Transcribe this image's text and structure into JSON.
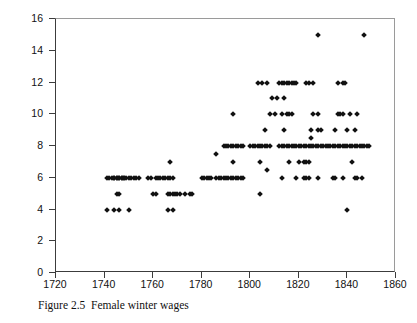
{
  "caption": "Figure 2.5  Female winter wages",
  "axis_color": "#3c3c3c",
  "marker_color": "#111111",
  "chart_data": {
    "type": "scatter",
    "title": "",
    "subtitle": "",
    "xlabel": "",
    "ylabel": "Female Winter Wage (d./day)",
    "xlim": [
      1720,
      1860
    ],
    "ylim": [
      0,
      16
    ],
    "xticks": [
      1720,
      1740,
      1760,
      1780,
      1800,
      1820,
      1840,
      1860
    ],
    "yticks": [
      0,
      2,
      4,
      6,
      8,
      10,
      12,
      14,
      16
    ],
    "grid": false,
    "legend": null,
    "marker": "diamond",
    "series": [
      {
        "name": "Female winter wage observations",
        "points": [
          [
            1741,
            6
          ],
          [
            1742,
            6
          ],
          [
            1743,
            6
          ],
          [
            1744,
            6
          ],
          [
            1744,
            6
          ],
          [
            1745,
            6
          ],
          [
            1745,
            6
          ],
          [
            1746,
            6
          ],
          [
            1746,
            6
          ],
          [
            1747,
            6
          ],
          [
            1747,
            6
          ],
          [
            1748,
            6
          ],
          [
            1748,
            6
          ],
          [
            1749,
            6
          ],
          [
            1750,
            6
          ],
          [
            1751,
            6
          ],
          [
            1752,
            6
          ],
          [
            1753,
            6
          ],
          [
            1754,
            6
          ],
          [
            1758,
            6
          ],
          [
            1759,
            6
          ],
          [
            1761,
            6
          ],
          [
            1762,
            6
          ],
          [
            1763,
            6
          ],
          [
            1764,
            6
          ],
          [
            1765,
            6
          ],
          [
            1766,
            6
          ],
          [
            1767,
            6
          ],
          [
            1768,
            6
          ],
          [
            1741,
            4
          ],
          [
            1744,
            4
          ],
          [
            1746,
            4
          ],
          [
            1750,
            4
          ],
          [
            1766,
            4
          ],
          [
            1768,
            4
          ],
          [
            1745,
            5
          ],
          [
            1746,
            5
          ],
          [
            1760,
            5
          ],
          [
            1761,
            5
          ],
          [
            1766,
            5
          ],
          [
            1767,
            5
          ],
          [
            1768,
            5
          ],
          [
            1769,
            5
          ],
          [
            1770,
            5
          ],
          [
            1771,
            5
          ],
          [
            1773,
            5
          ],
          [
            1775,
            5
          ],
          [
            1776,
            5
          ],
          [
            1767,
            7
          ],
          [
            1780,
            6
          ],
          [
            1781,
            6
          ],
          [
            1782,
            6
          ],
          [
            1783,
            6
          ],
          [
            1784,
            6
          ],
          [
            1786,
            6
          ],
          [
            1787,
            6
          ],
          [
            1788,
            6
          ],
          [
            1789,
            6
          ],
          [
            1790,
            6
          ],
          [
            1791,
            6
          ],
          [
            1792,
            6
          ],
          [
            1793,
            6
          ],
          [
            1794,
            6
          ],
          [
            1795,
            6
          ],
          [
            1796,
            6
          ],
          [
            1797,
            6
          ],
          [
            1786,
            7.5
          ],
          [
            1789,
            8
          ],
          [
            1790,
            8
          ],
          [
            1791,
            8
          ],
          [
            1792,
            8
          ],
          [
            1793,
            8
          ],
          [
            1794,
            8
          ],
          [
            1795,
            8
          ],
          [
            1796,
            8
          ],
          [
            1797,
            8
          ],
          [
            1793,
            10
          ],
          [
            1793,
            7
          ],
          [
            1800,
            8
          ],
          [
            1801,
            8
          ],
          [
            1802,
            8
          ],
          [
            1803,
            8
          ],
          [
            1804,
            8
          ],
          [
            1805,
            8
          ],
          [
            1806,
            8
          ],
          [
            1807,
            8
          ],
          [
            1808,
            8
          ],
          [
            1803,
            12
          ],
          [
            1805,
            12
          ],
          [
            1807,
            12
          ],
          [
            1804,
            5
          ],
          [
            1804,
            7
          ],
          [
            1806,
            9
          ],
          [
            1807,
            6.5
          ],
          [
            1808,
            10
          ],
          [
            1810,
            10
          ],
          [
            1809,
            11
          ],
          [
            1811,
            11
          ],
          [
            1814,
            11
          ],
          [
            1812,
            12
          ],
          [
            1813,
            12
          ],
          [
            1814,
            12
          ],
          [
            1815,
            12
          ],
          [
            1816,
            12
          ],
          [
            1817,
            12
          ],
          [
            1818,
            12
          ],
          [
            1819,
            12
          ],
          [
            1812,
            8
          ],
          [
            1813,
            8
          ],
          [
            1814,
            8
          ],
          [
            1815,
            8
          ],
          [
            1816,
            8
          ],
          [
            1817,
            8
          ],
          [
            1818,
            8
          ],
          [
            1819,
            8
          ],
          [
            1813,
            10
          ],
          [
            1815,
            10
          ],
          [
            1816,
            10
          ],
          [
            1817,
            10
          ],
          [
            1814,
            9
          ],
          [
            1813,
            6
          ],
          [
            1816,
            7
          ],
          [
            1820,
            8
          ],
          [
            1821,
            8
          ],
          [
            1822,
            8
          ],
          [
            1823,
            8
          ],
          [
            1824,
            8
          ],
          [
            1825,
            8
          ],
          [
            1826,
            8
          ],
          [
            1827,
            8
          ],
          [
            1828,
            8
          ],
          [
            1829,
            8
          ],
          [
            1830,
            8
          ],
          [
            1831,
            8
          ],
          [
            1832,
            8
          ],
          [
            1833,
            8
          ],
          [
            1834,
            8
          ],
          [
            1835,
            8
          ],
          [
            1836,
            8
          ],
          [
            1837,
            8
          ],
          [
            1838,
            8
          ],
          [
            1839,
            8
          ],
          [
            1840,
            8
          ],
          [
            1841,
            8
          ],
          [
            1842,
            8
          ],
          [
            1843,
            8
          ],
          [
            1844,
            8
          ],
          [
            1845,
            8
          ],
          [
            1846,
            8
          ],
          [
            1847,
            8
          ],
          [
            1848,
            8
          ],
          [
            1849,
            8
          ],
          [
            1820,
            7
          ],
          [
            1822,
            7
          ],
          [
            1823,
            7
          ],
          [
            1824,
            7
          ],
          [
            1819,
            6
          ],
          [
            1822,
            6
          ],
          [
            1823,
            6
          ],
          [
            1824,
            6
          ],
          [
            1828,
            6
          ],
          [
            1834,
            6
          ],
          [
            1835,
            6
          ],
          [
            1838,
            6
          ],
          [
            1823,
            12
          ],
          [
            1824,
            12
          ],
          [
            1826,
            12
          ],
          [
            1825,
            8.5
          ],
          [
            1826,
            10
          ],
          [
            1828,
            10
          ],
          [
            1825,
            9
          ],
          [
            1828,
            9
          ],
          [
            1829,
            9
          ],
          [
            1828,
            15
          ],
          [
            1847,
            15
          ],
          [
            1836,
            12
          ],
          [
            1838,
            12
          ],
          [
            1839,
            12
          ],
          [
            1836,
            10
          ],
          [
            1837,
            10
          ],
          [
            1838,
            10
          ],
          [
            1841,
            10
          ],
          [
            1844,
            10
          ],
          [
            1835,
            9
          ],
          [
            1840,
            9
          ],
          [
            1843,
            9
          ],
          [
            1840,
            4
          ],
          [
            1842,
            7
          ],
          [
            1843,
            6
          ],
          [
            1844,
            6
          ],
          [
            1846,
            6
          ]
        ]
      }
    ]
  }
}
